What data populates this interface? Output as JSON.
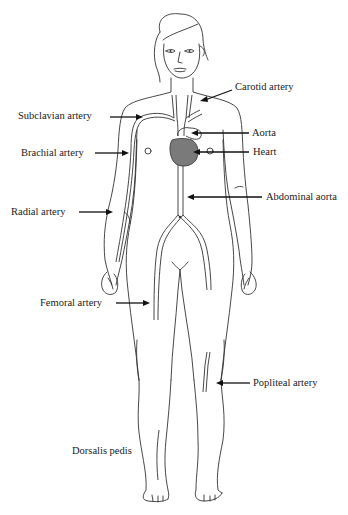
{
  "diagram": {
    "heart_color": "#7a7a7a",
    "line_color": "#333333",
    "labels": [
      {
        "id": "carotid",
        "text": "Carotid artery",
        "x": 235,
        "y": 86
      },
      {
        "id": "subclavian",
        "text": "Subclavian artery",
        "x": 18,
        "y": 109
      },
      {
        "id": "aorta",
        "text": "Aorta",
        "x": 252,
        "y": 126
      },
      {
        "id": "brachial",
        "text": "Brachial artery",
        "x": 21,
        "y": 147
      },
      {
        "id": "heart",
        "text": "Heart",
        "x": 253,
        "y": 146
      },
      {
        "id": "abdominal_aorta",
        "text": "Abdominal aorta",
        "x": 266,
        "y": 190
      },
      {
        "id": "radial",
        "text": "Radial artery",
        "x": 11,
        "y": 207
      },
      {
        "id": "femoral",
        "text": "Femoral artery",
        "x": 40,
        "y": 296
      },
      {
        "id": "popliteal",
        "text": "Popliteal artery",
        "x": 253,
        "y": 376
      },
      {
        "id": "dorsalis_pedis",
        "text": "Dorsalis pedis",
        "x": 72,
        "y": 446
      }
    ]
  }
}
